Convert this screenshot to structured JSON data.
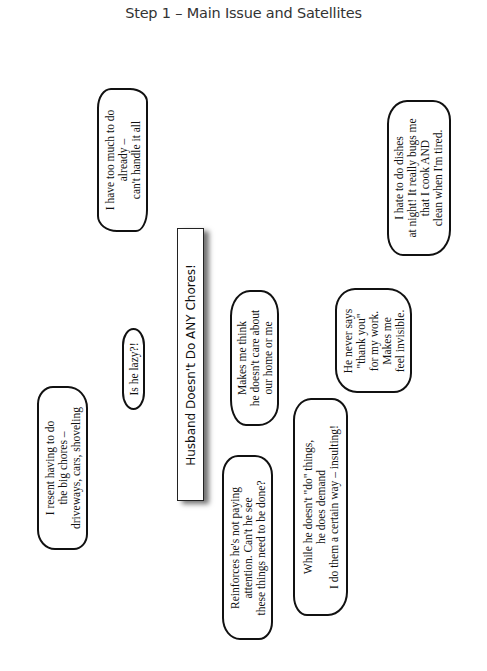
{
  "title": "Step 1 – Main Issue and Satellites",
  "main_issue": {
    "text": "Husband Doesn't Do ANY Chores!"
  },
  "satellites": [
    {
      "id": "too-much",
      "lines": [
        "I have too much to do",
        "already –",
        "can't handle it all"
      ]
    },
    {
      "id": "lazy",
      "lines": [
        "Is he lazy?!"
      ]
    },
    {
      "id": "big-chores",
      "lines": [
        "I resent having to do",
        "the big chores –",
        "driveways, cars, shoveling"
      ]
    },
    {
      "id": "dont-care",
      "lines": [
        "Makes me think",
        "he doesn't care about",
        "our home or me"
      ]
    },
    {
      "id": "not-paying-attention",
      "lines": [
        "Reinforces he's not paying",
        "attention.  Can't he see",
        "these things need to be done?"
      ]
    },
    {
      "id": "demands",
      "lines": [
        "While he doesn't \"do\" things,",
        "he does demand",
        "I do them a certain way – insulting!"
      ]
    },
    {
      "id": "thank-you",
      "lines": [
        "He never says",
        "\"thank you\"",
        "for my work.",
        "Makes me",
        "feel invisible."
      ]
    },
    {
      "id": "dishes",
      "lines": [
        "I hate to do dishes",
        "at night! It really bugs me",
        "that I cook AND",
        "clean when I'm tired."
      ]
    }
  ],
  "colors": {
    "ink": "#111111",
    "title": "#333333",
    "background": "#ffffff"
  }
}
